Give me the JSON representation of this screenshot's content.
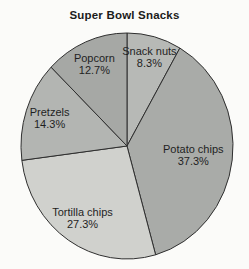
{
  "chart_data": {
    "type": "pie",
    "title": "Super Bowl Snacks",
    "unit": "%",
    "start_angle_deg": 0,
    "direction": "clockwise",
    "legend": "none",
    "slices": [
      {
        "label": "Snack nuts",
        "value": 8.3,
        "display": "8.3%",
        "color": "#b7b9b6",
        "label_r": 0.82
      },
      {
        "label": "Potato chips",
        "value": 37.3,
        "display": "37.3%",
        "color": "#a9aba8",
        "label_r": 0.63
      },
      {
        "label": "Tortilla chips",
        "value": 27.3,
        "display": "27.3%",
        "color": "#d0d1cd",
        "label_r": 0.76
      },
      {
        "label": "Pretzels",
        "value": 14.3,
        "display": "14.3%",
        "color": "#b3b5b2",
        "label_r": 0.77
      },
      {
        "label": "Popcorn",
        "value": 12.7,
        "display": "12.7%",
        "color": "#a6a8a5",
        "label_r": 0.79
      }
    ],
    "geometry": {
      "cx": 127,
      "cy": 146,
      "rx": 106,
      "ry": 113,
      "stroke": "#2f2f2f",
      "stroke_width": 1
    },
    "label_color": "#1f1f1f"
  }
}
